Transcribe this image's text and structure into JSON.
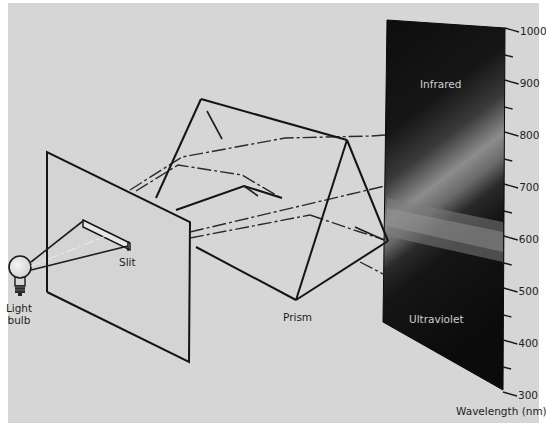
{
  "figure": {
    "background_color": "#d6d6d6",
    "screen_color": "#0e0e0e",
    "spectrum_band_color": "#8a8a8a"
  },
  "labels": {
    "light_bulb_line1": "Light",
    "light_bulb_line2": "bulb",
    "slit": "Slit",
    "prism": "Prism",
    "infrared": "Infrared",
    "ultraviolet": "Ultraviolet",
    "axis_title": "Wavelength (nm)"
  },
  "components": [
    {
      "id": "light-bulb",
      "name": "Light bulb"
    },
    {
      "id": "slit-plate",
      "name": "Slit"
    },
    {
      "id": "prism",
      "name": "Prism"
    },
    {
      "id": "screen",
      "name": "Spectrum screen"
    }
  ],
  "wavelength_scale": {
    "unit": "nm",
    "min": 300,
    "max": 1000,
    "major_ticks": [
      "1000",
      "900",
      "800",
      "700",
      "600",
      "500",
      "400",
      "300"
    ],
    "minor_ticks_between_majors": 1,
    "upper_region": "Infrared",
    "lower_region": "Ultraviolet"
  }
}
